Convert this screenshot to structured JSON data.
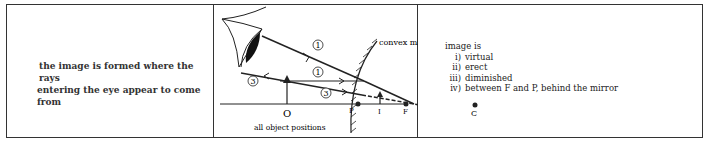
{
  "description": {
    "line1": "the image is formed where the rays",
    "line2": "entering the eye appear to come from"
  },
  "diagram": {
    "mirror_label": "convex mirror",
    "object_label": "O",
    "pole_label": "P",
    "image_label": "I",
    "focus_label": "F",
    "centre_label": "C",
    "caption": "all object positions",
    "ray_labels": [
      "1",
      "1",
      "3",
      "3"
    ]
  },
  "properties": {
    "heading": "image is",
    "items": [
      {
        "num": "i)",
        "text": "virtual"
      },
      {
        "num": "ii)",
        "text": "erect"
      },
      {
        "num": "iii)",
        "text": "diminished"
      },
      {
        "num": "iv)",
        "text": "between F and P, behind the mirror"
      }
    ]
  }
}
